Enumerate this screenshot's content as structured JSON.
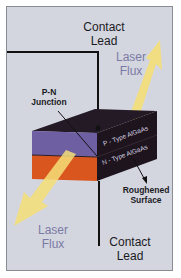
{
  "diagram": {
    "labels": {
      "contact_lead_top": [
        "Contact",
        "Lead"
      ],
      "laser_flux_top": [
        "Laser",
        "Flux"
      ],
      "pn_junction": [
        "P-N",
        "Junction"
      ],
      "p_type_layer": "P - Type AlGaAs",
      "n_type_layer": "N - Type AlGaAs",
      "roughened_surface": [
        "Roughened",
        "Surface"
      ],
      "laser_flux_bottom": [
        "Laser",
        "Flux"
      ],
      "contact_lead_bottom": [
        "Contact",
        "Lead"
      ]
    },
    "colors": {
      "background": "#d4d6df",
      "p_layer_front": "#6e5fa3",
      "n_layer_front": "#d9561e",
      "block_top": "#231a26",
      "block_side": "#1d141d",
      "laser_beam": "#f5df78",
      "flux_text": "#7b7aa6",
      "lead_line": "#111111"
    }
  }
}
